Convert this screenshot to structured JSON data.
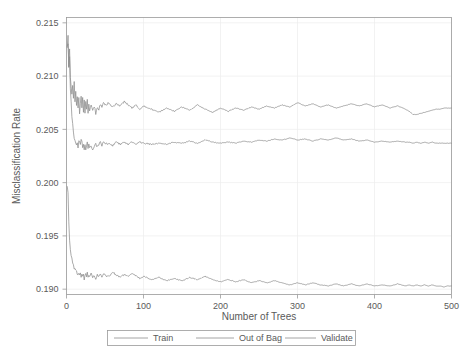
{
  "chart_data": {
    "type": "line",
    "title": "",
    "xlabel": "Number of Trees",
    "ylabel": "Misclassification Rate",
    "xlim": [
      0,
      500
    ],
    "ylim": [
      0.1895,
      0.2155
    ],
    "xticks": [
      0,
      100,
      200,
      300,
      400,
      500
    ],
    "yticks": [
      0.19,
      0.195,
      0.2,
      0.205,
      0.21,
      0.215
    ],
    "xtick_labels": [
      "0",
      "100",
      "200",
      "300",
      "400",
      "500"
    ],
    "ytick_labels": [
      "0.190",
      "0.195",
      "0.200",
      "0.205",
      "0.210",
      "0.215"
    ],
    "grid": true,
    "legend_position": "bottom",
    "line_color": "#8d8d8d",
    "frame_color": "#9a9a9a",
    "grid_color": "#ececec",
    "background": "#ffffff",
    "x": [
      1,
      2,
      3,
      4,
      5,
      6,
      7,
      8,
      9,
      10,
      11,
      12,
      13,
      14,
      15,
      16,
      17,
      18,
      19,
      20,
      21,
      22,
      23,
      24,
      25,
      26,
      27,
      28,
      29,
      30,
      32,
      34,
      36,
      38,
      40,
      42,
      44,
      46,
      48,
      50,
      55,
      60,
      65,
      70,
      75,
      80,
      85,
      90,
      95,
      100,
      110,
      120,
      130,
      140,
      150,
      160,
      170,
      180,
      190,
      200,
      210,
      220,
      230,
      240,
      250,
      260,
      270,
      280,
      290,
      300,
      310,
      320,
      330,
      340,
      350,
      360,
      370,
      380,
      390,
      400,
      410,
      420,
      430,
      440,
      445,
      450,
      455,
      460,
      465,
      470,
      475,
      480,
      485,
      490,
      495,
      500
    ],
    "series": [
      {
        "name": "Out of Bag",
        "final_value": 0.207,
        "values": [
          0.2128,
          0.2138,
          0.211,
          0.2126,
          0.2098,
          0.209,
          0.2084,
          0.2092,
          0.208,
          0.2094,
          0.2076,
          0.2086,
          0.2072,
          0.2082,
          0.207,
          0.2079,
          0.2066,
          0.2076,
          0.2082,
          0.207,
          0.2079,
          0.2067,
          0.2077,
          0.2064,
          0.2076,
          0.2068,
          0.2078,
          0.2066,
          0.2074,
          0.2068,
          0.2073,
          0.2067,
          0.2072,
          0.2065,
          0.2071,
          0.2069,
          0.2074,
          0.207,
          0.2076,
          0.2072,
          0.2075,
          0.2071,
          0.2074,
          0.2072,
          0.2076,
          0.2073,
          0.207,
          0.2073,
          0.2069,
          0.2072,
          0.2069,
          0.2066,
          0.207,
          0.2067,
          0.2071,
          0.2068,
          0.2073,
          0.2069,
          0.2066,
          0.207,
          0.2067,
          0.207,
          0.2068,
          0.2071,
          0.2069,
          0.2072,
          0.207,
          0.2073,
          0.2071,
          0.2075,
          0.2072,
          0.2074,
          0.2071,
          0.2073,
          0.207,
          0.2072,
          0.2074,
          0.2072,
          0.2074,
          0.2071,
          0.2073,
          0.207,
          0.2072,
          0.2069,
          0.2067,
          0.2064,
          0.2064,
          0.2065,
          0.2066,
          0.2067,
          0.2068,
          0.2069,
          0.2069,
          0.207,
          0.207,
          0.207
        ]
      },
      {
        "name": "Validate",
        "final_value": 0.2037,
        "values": [
          0.2128,
          0.2132,
          0.2106,
          0.2118,
          0.2088,
          0.2076,
          0.2062,
          0.2054,
          0.2046,
          0.2042,
          0.2038,
          0.2036,
          0.2034,
          0.2036,
          0.2033,
          0.2038,
          0.204,
          0.2036,
          0.2041,
          0.2038,
          0.2034,
          0.2036,
          0.2032,
          0.2035,
          0.2031,
          0.2034,
          0.2037,
          0.2033,
          0.2036,
          0.2032,
          0.2034,
          0.2031,
          0.2034,
          0.2036,
          0.2033,
          0.2036,
          0.2038,
          0.2035,
          0.2038,
          0.2036,
          0.2037,
          0.2035,
          0.2038,
          0.2036,
          0.2038,
          0.2036,
          0.2038,
          0.2036,
          0.2038,
          0.2037,
          0.2036,
          0.2037,
          0.2036,
          0.2038,
          0.2037,
          0.2039,
          0.2037,
          0.204,
          0.2038,
          0.2037,
          0.2038,
          0.2037,
          0.2039,
          0.2038,
          0.204,
          0.2039,
          0.2041,
          0.204,
          0.2042,
          0.204,
          0.2041,
          0.2039,
          0.2041,
          0.204,
          0.2042,
          0.204,
          0.2041,
          0.2039,
          0.204,
          0.2038,
          0.2039,
          0.2038,
          0.2039,
          0.2038,
          0.2038,
          0.2037,
          0.2038,
          0.2037,
          0.2038,
          0.2037,
          0.2038,
          0.2037,
          0.2037,
          0.2037,
          0.2037,
          0.2037
        ]
      },
      {
        "name": "Train",
        "final_value": 0.1903,
        "values": [
          0.1995,
          0.199,
          0.1962,
          0.1948,
          0.1938,
          0.1932,
          0.1928,
          0.1924,
          0.1922,
          0.192,
          0.1918,
          0.1917,
          0.1916,
          0.1915,
          0.1914,
          0.1916,
          0.1913,
          0.1915,
          0.1912,
          0.1914,
          0.1911,
          0.1913,
          0.191,
          0.1913,
          0.1916,
          0.1912,
          0.1915,
          0.1911,
          0.1914,
          0.1912,
          0.1914,
          0.1911,
          0.1913,
          0.191,
          0.1913,
          0.1911,
          0.1914,
          0.1912,
          0.1915,
          0.1913,
          0.1912,
          0.1916,
          0.1913,
          0.1911,
          0.1914,
          0.1912,
          0.1915,
          0.1913,
          0.191,
          0.1912,
          0.1909,
          0.1911,
          0.1908,
          0.191,
          0.1908,
          0.1911,
          0.1909,
          0.1912,
          0.1909,
          0.1907,
          0.1909,
          0.1907,
          0.1909,
          0.1906,
          0.1908,
          0.1906,
          0.1908,
          0.1906,
          0.1904,
          0.1906,
          0.1904,
          0.1906,
          0.1904,
          0.1903,
          0.1905,
          0.1903,
          0.1905,
          0.1903,
          0.1905,
          0.1903,
          0.1904,
          0.1903,
          0.1905,
          0.1903,
          0.1904,
          0.1903,
          0.1904,
          0.1903,
          0.1904,
          0.1903,
          0.1904,
          0.1903,
          0.1903,
          0.1902,
          0.1903,
          0.1903
        ]
      }
    ]
  },
  "legend": {
    "entries": [
      {
        "label": "Train"
      },
      {
        "label": "Out of Bag"
      },
      {
        "label": "Validate"
      }
    ]
  }
}
